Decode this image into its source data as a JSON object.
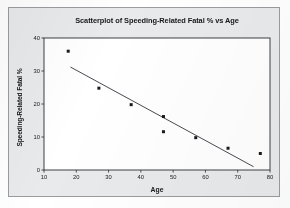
{
  "chart_data": {
    "type": "scatter",
    "title": "Scatterplot of Speeding-Related Fatal % vs Age",
    "xlabel": "Age",
    "ylabel": "Speeding-Related Fatal %",
    "xlim": [
      10,
      80
    ],
    "ylim": [
      0,
      40
    ],
    "xticks": [
      10,
      20,
      30,
      40,
      50,
      60,
      70,
      80
    ],
    "yticks": [
      0,
      10,
      20,
      30,
      40
    ],
    "grid": false,
    "legend": null,
    "x": [
      17.5,
      27,
      37,
      47,
      47,
      57,
      67,
      77
    ],
    "y": [
      36,
      24.8,
      19.8,
      16.2,
      11.6,
      9.8,
      6.6,
      5
    ],
    "points": [
      {
        "age": 17.5,
        "percent": 36
      },
      {
        "age": 27,
        "percent": 24.8
      },
      {
        "age": 37,
        "percent": 19.8
      },
      {
        "age": 47,
        "percent": 16.2
      },
      {
        "age": 47,
        "percent": 11.6
      },
      {
        "age": 57,
        "percent": 9.8
      },
      {
        "age": 67,
        "percent": 6.6
      },
      {
        "age": 77,
        "percent": 5
      }
    ],
    "marker": {
      "shape": "square",
      "color": "#1a1a1a",
      "size": 3
    },
    "fit_line": {
      "type": "linear-regression",
      "color": "#4a4a52",
      "x_start": 18.2,
      "y_start": 31.2,
      "x_end": 74.9,
      "y_end": 1.0
    },
    "colors": {
      "plot_background": "#ffffff",
      "panel_background": "#e9eaec",
      "axis": "#2a2c31",
      "text": "#16181c",
      "point": "#1a1a1a",
      "line": "#4a4a52"
    }
  }
}
